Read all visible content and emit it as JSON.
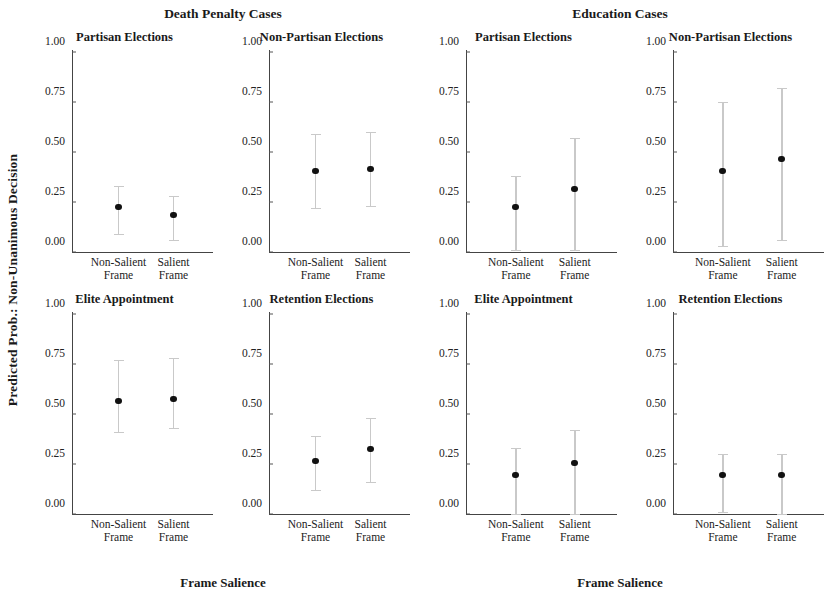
{
  "figure": {
    "ylabel": "Predicted Prob.: Non-Unanimous Decision",
    "xlabel": "Frame Salience"
  },
  "groups": [
    {
      "title": "Death Penalty Cases",
      "panels": [
        {
          "title": "Partisan Elections"
        },
        {
          "title": "Non-Partisan Elections"
        },
        {
          "title": "Elite Appointment"
        },
        {
          "title": "Retention Elections"
        }
      ]
    },
    {
      "title": "Education Cases",
      "panels": [
        {
          "title": "Partisan Elections"
        },
        {
          "title": "Non-Partisan Elections"
        },
        {
          "title": "Elite Appointment"
        },
        {
          "title": "Retention Elections"
        }
      ]
    }
  ],
  "axis": {
    "yticks": [
      "1.00",
      "0.75",
      "0.50",
      "0.25",
      "0.00"
    ],
    "ytick_values": [
      1.0,
      0.75,
      0.5,
      0.25,
      0.0
    ],
    "xticks": [
      "Non-Salient\nFrame",
      "Salient Frame"
    ]
  },
  "chart_data": {
    "type": "scatter",
    "xlabel": "Frame Salience",
    "ylabel": "Predicted Prob.: Non-Unanimous Decision",
    "ylim": [
      0.0,
      1.0
    ],
    "ytick_values": [
      0.0,
      0.25,
      0.5,
      0.75,
      1.0
    ],
    "categories": [
      "Non-Salient Frame",
      "Salient Frame"
    ],
    "grid": false,
    "legend": "none",
    "error_bars": "95% confidence interval",
    "marker": "filled circle, black",
    "errorbar_color": "#c9c9c9",
    "panels": [
      {
        "group": "Death Penalty Cases",
        "panel": "Partisan Elections",
        "values": [
          0.23,
          0.19
        ],
        "ci_low": [
          0.09,
          0.06
        ],
        "ci_high": [
          0.33,
          0.28
        ]
      },
      {
        "group": "Death Penalty Cases",
        "panel": "Non-Partisan Elections",
        "values": [
          0.41,
          0.42
        ],
        "ci_low": [
          0.22,
          0.23
        ],
        "ci_high": [
          0.59,
          0.6
        ]
      },
      {
        "group": "Death Penalty Cases",
        "panel": "Elite Appointment",
        "values": [
          0.57,
          0.58
        ],
        "ci_low": [
          0.41,
          0.43
        ],
        "ci_high": [
          0.77,
          0.78
        ]
      },
      {
        "group": "Death Penalty Cases",
        "panel": "Retention Elections",
        "values": [
          0.27,
          0.33
        ],
        "ci_low": [
          0.12,
          0.16
        ],
        "ci_high": [
          0.39,
          0.48
        ]
      },
      {
        "group": "Education Cases",
        "panel": "Partisan Elections",
        "values": [
          0.23,
          0.32
        ],
        "ci_low": [
          0.01,
          0.01
        ],
        "ci_high": [
          0.38,
          0.57
        ]
      },
      {
        "group": "Education Cases",
        "panel": "Non-Partisan Elections",
        "values": [
          0.41,
          0.47
        ],
        "ci_low": [
          0.03,
          0.06
        ],
        "ci_high": [
          0.75,
          0.82
        ]
      },
      {
        "group": "Education Cases",
        "panel": "Elite Appointment",
        "values": [
          0.2,
          0.26
        ],
        "ci_low": [
          0.0,
          0.0
        ],
        "ci_high": [
          0.33,
          0.42
        ]
      },
      {
        "group": "Education Cases",
        "panel": "Retention Elections",
        "values": [
          0.2,
          0.2
        ],
        "ci_low": [
          0.01,
          0.0
        ],
        "ci_high": [
          0.3,
          0.3
        ]
      }
    ]
  }
}
